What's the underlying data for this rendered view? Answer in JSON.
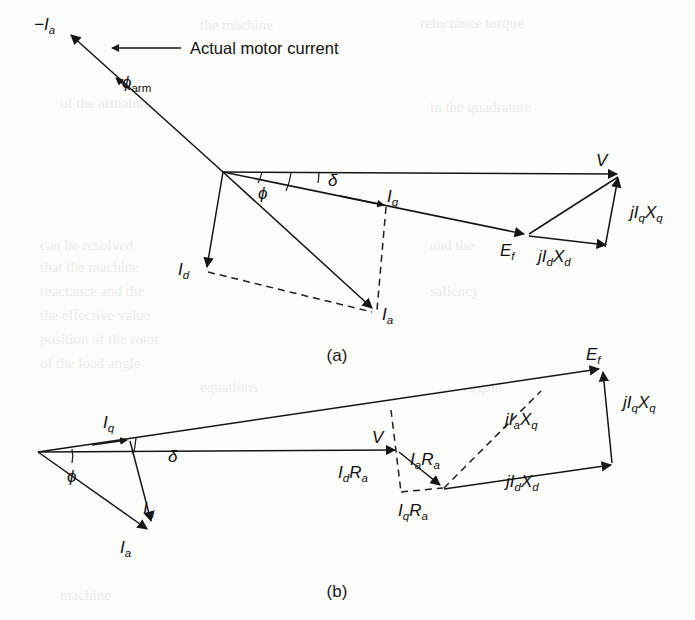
{
  "figure": {
    "annotation": "Actual motor current",
    "captions": {
      "a": "(a)",
      "b": "(b)"
    }
  },
  "diagram_a": {
    "caption": "(a)",
    "labels": {
      "neg_ia": "−I",
      "neg_ia_sub": "a",
      "phi_arm": "ϕ",
      "phi_arm_sub": "arm",
      "phi": "ϕ",
      "delta": "δ",
      "iq": "I",
      "iq_sub": "q",
      "id": "I",
      "id_sub": "d",
      "ia": "I",
      "ia_sub": "a",
      "v": "V",
      "ef": "E",
      "ef_sub": "f",
      "jiqxq": "jI",
      "jiqxq_sub1": "q",
      "jiqxq_x": "X",
      "jiqxq_sub2": "q",
      "jidxd": "jI",
      "jidxd_sub1": "d",
      "jidxd_x": "X",
      "jidxd_sub2": "d"
    }
  },
  "diagram_b": {
    "caption": "(b)",
    "labels": {
      "iq": "I",
      "iq_sub": "q",
      "id": "I",
      "id_sub": "d",
      "ia": "I",
      "ia_sub": "a",
      "phi": "ϕ",
      "delta": "δ",
      "v": "V",
      "ef": "E",
      "ef_sub": "f",
      "iara": "I",
      "iara_sub1": "a",
      "iara_r": "R",
      "iara_sub2": "a",
      "idra": "I",
      "idra_sub1": "d",
      "idra_r": "R",
      "idra_sub2": "a",
      "iqra": "I",
      "iqra_sub1": "q",
      "iqra_r": "R",
      "iqra_sub2": "a",
      "jiaxq": "jI",
      "jiaxq_sub1": "a",
      "jiaxq_x": "X",
      "jiaxq_sub2": "q",
      "jidxd": "jI",
      "jidxd_sub1": "d",
      "jidxd_x": "X",
      "jidxd_sub2": "d",
      "jiqxq": "jI",
      "jiqxq_sub1": "q",
      "jiqxq_x": "X",
      "jiqxq_sub2": "q"
    }
  },
  "colors": {
    "ink": "#151515",
    "paper": "#fdfdfc",
    "bleed": "#ebebe8"
  }
}
